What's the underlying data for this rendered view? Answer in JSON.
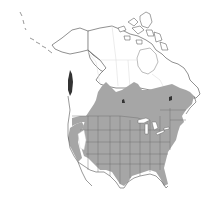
{
  "map": {
    "title": "",
    "type": "species-range-map",
    "region": "North America",
    "colors": {
      "background": "#ffffff",
      "range_fill": "#a6a6a6",
      "outline": "#444444",
      "internal_borders": "#6b6b6b"
    },
    "features": [
      {
        "name": "alaska",
        "shaded": false
      },
      {
        "name": "canada-north",
        "shaded": false
      },
      {
        "name": "canadian-arctic-archipelago",
        "shaded": false
      },
      {
        "name": "greenland-edge",
        "shaded": false
      },
      {
        "name": "southern-canada",
        "shaded": true
      },
      {
        "name": "contiguous-united-states",
        "shaded": true
      },
      {
        "name": "pacific-coast-strip",
        "shaded": true
      },
      {
        "name": "great-basin-gap",
        "shaded": false
      },
      {
        "name": "northern-mexico",
        "shaded": false
      },
      {
        "name": "great-lakes",
        "shaded": false
      }
    ]
  }
}
